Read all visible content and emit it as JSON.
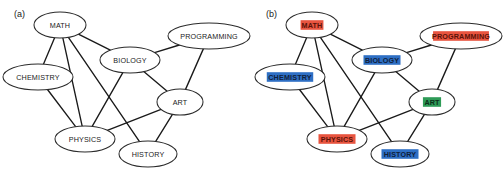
{
  "figure": {
    "width": 504,
    "height": 177,
    "background": "#ffffff"
  },
  "panels": [
    {
      "id": "a",
      "label": "(a)",
      "highlighted": false
    },
    {
      "id": "b",
      "label": "(b)",
      "highlighted": true
    }
  ],
  "graph": {
    "nodes": [
      {
        "id": "math",
        "label": "MATH",
        "x": 60,
        "y": 25,
        "rx": 26,
        "ry": 13,
        "highlight": "#E8543F",
        "text_on_highlight": "#5a1208"
      },
      {
        "id": "chemistry",
        "label": "CHEMISTRY",
        "x": 38,
        "y": 77,
        "rx": 35,
        "ry": 13,
        "highlight": "#2E6FC4",
        "text_on_highlight": "#10203a"
      },
      {
        "id": "biology",
        "label": "BIOLOGY",
        "x": 130,
        "y": 60,
        "rx": 30,
        "ry": 13,
        "highlight": "#2E6FC4",
        "text_on_highlight": "#10203a"
      },
      {
        "id": "programming",
        "label": "PROGRAMMING",
        "x": 209,
        "y": 36,
        "rx": 41,
        "ry": 13,
        "highlight": "#E8543F",
        "text_on_highlight": "#5a1208"
      },
      {
        "id": "art",
        "label": "ART",
        "x": 180,
        "y": 102,
        "rx": 23,
        "ry": 13,
        "highlight": "#2E9B57",
        "text_on_highlight": "#0c2e1a"
      },
      {
        "id": "physics",
        "label": "PHYSICS",
        "x": 85,
        "y": 139,
        "rx": 30,
        "ry": 13,
        "highlight": "#E8543F",
        "text_on_highlight": "#5a1208"
      },
      {
        "id": "history",
        "label": "HISTORY",
        "x": 148,
        "y": 154,
        "rx": 29,
        "ry": 13,
        "highlight": "#2E6FC4",
        "text_on_highlight": "#10203a"
      }
    ],
    "edges": [
      {
        "source": "math",
        "target": "chemistry"
      },
      {
        "source": "math",
        "target": "biology"
      },
      {
        "source": "math",
        "target": "physics"
      },
      {
        "source": "math",
        "target": "history"
      },
      {
        "source": "chemistry",
        "target": "physics"
      },
      {
        "source": "biology",
        "target": "programming"
      },
      {
        "source": "biology",
        "target": "physics"
      },
      {
        "source": "biology",
        "target": "art"
      },
      {
        "source": "programming",
        "target": "art"
      },
      {
        "source": "art",
        "target": "physics"
      },
      {
        "source": "art",
        "target": "history"
      }
    ]
  },
  "style": {
    "edge_color": "#1a1a1a",
    "node_fill": "#ffffff",
    "node_stroke": "#2b2b2b",
    "label_color": "#1a1a1a"
  }
}
